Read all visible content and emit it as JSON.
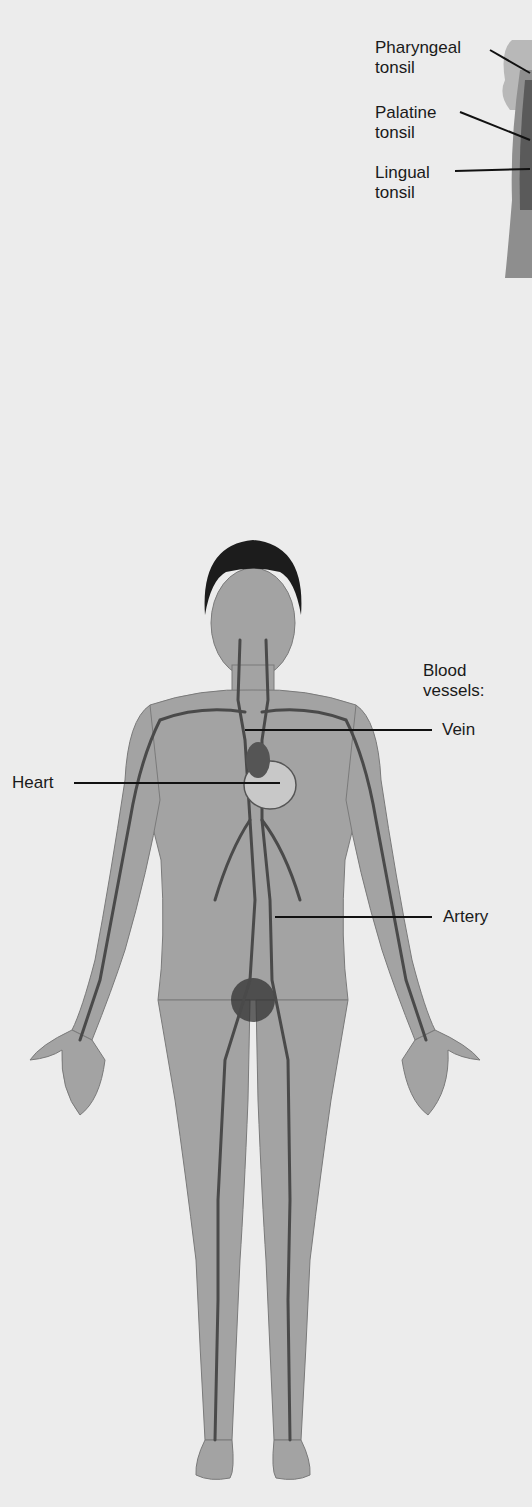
{
  "figure": {
    "tonsils_panel": {
      "labels": [
        {
          "line1": "Pharyngeal",
          "line2": "tonsil"
        },
        {
          "line1": "Palatine",
          "line2": "tonsil"
        },
        {
          "line1": "Lingual",
          "line2": "tonsil"
        }
      ]
    },
    "circulatory_panel": {
      "group_label_line1": "Blood",
      "group_label_line2": "vessels:",
      "labels": {
        "vein": "Vein",
        "heart": "Heart",
        "artery": "Artery"
      }
    },
    "colors": {
      "background": "#ececec",
      "skin": "#9a9a9a",
      "vessel": "#4a4a4a",
      "hair": "#1c1c1c",
      "leader_line": "#111111"
    }
  }
}
